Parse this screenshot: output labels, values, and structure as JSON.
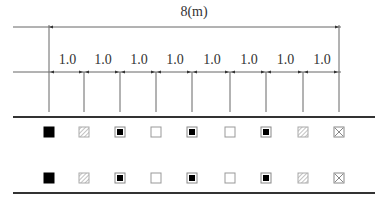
{
  "diagram": {
    "total_label": "8(m)",
    "spacing_labels": [
      "1.0",
      "1.0",
      "1.0",
      "1.0",
      "1.0",
      "1.0",
      "1.0",
      "1.0"
    ],
    "tick_x": [
      49,
      84,
      120,
      156,
      192,
      230,
      266,
      303,
      339
    ],
    "rows": [
      {
        "name": "row-1",
        "symbols": [
          "filled-square",
          "hatched-square",
          "dotted-square",
          "empty-square",
          "dotted-square",
          "empty-square",
          "dotted-square",
          "hatched-square",
          "crossed-square"
        ]
      },
      {
        "name": "row-2",
        "symbols": [
          "filled-square",
          "hatched-square",
          "dotted-square",
          "empty-square",
          "dotted-square",
          "empty-square",
          "dotted-square",
          "hatched-square",
          "crossed-square"
        ]
      }
    ],
    "colors": {
      "line": "#555555",
      "thick_line": "#333333",
      "fill": "#000000",
      "hatch": "#999999",
      "outline": "#999999"
    }
  }
}
